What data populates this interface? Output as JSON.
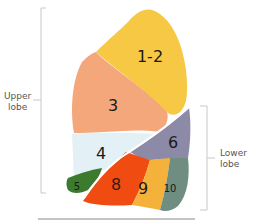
{
  "diagram": {
    "lobes": {
      "upper": {
        "label_line1": "Upper",
        "label_line2": "lobe"
      },
      "lower": {
        "label_line1": "Lower",
        "label_line2": "lobe"
      }
    },
    "segments": [
      {
        "id": "1-2",
        "label": "1-2",
        "color": "#f7c843"
      },
      {
        "id": "3",
        "label": "3",
        "color": "#f4a77a"
      },
      {
        "id": "4",
        "label": "4",
        "color": "#e3f1f7"
      },
      {
        "id": "5",
        "label": "5",
        "color": "#3c7a2e"
      },
      {
        "id": "6",
        "label": "6",
        "color": "#8d8aa8"
      },
      {
        "id": "8",
        "label": "8",
        "color": "#f04c12"
      },
      {
        "id": "9",
        "label": "9",
        "color": "#f5b23a"
      },
      {
        "id": "10",
        "label": "10",
        "color": "#6f8d80"
      }
    ],
    "bracket_color": "#c8c8c8"
  }
}
